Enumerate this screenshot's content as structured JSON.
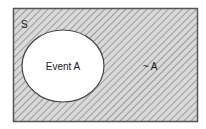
{
  "diagram": {
    "type": "venn",
    "sample_space_label": "S",
    "event_label": "Event A",
    "complement_label": "~ A",
    "colors": {
      "border": "#555555",
      "hatch_background": "#d9d9d9",
      "hatch_line": "#8a8a8a",
      "event_fill": "#ffffff"
    }
  }
}
